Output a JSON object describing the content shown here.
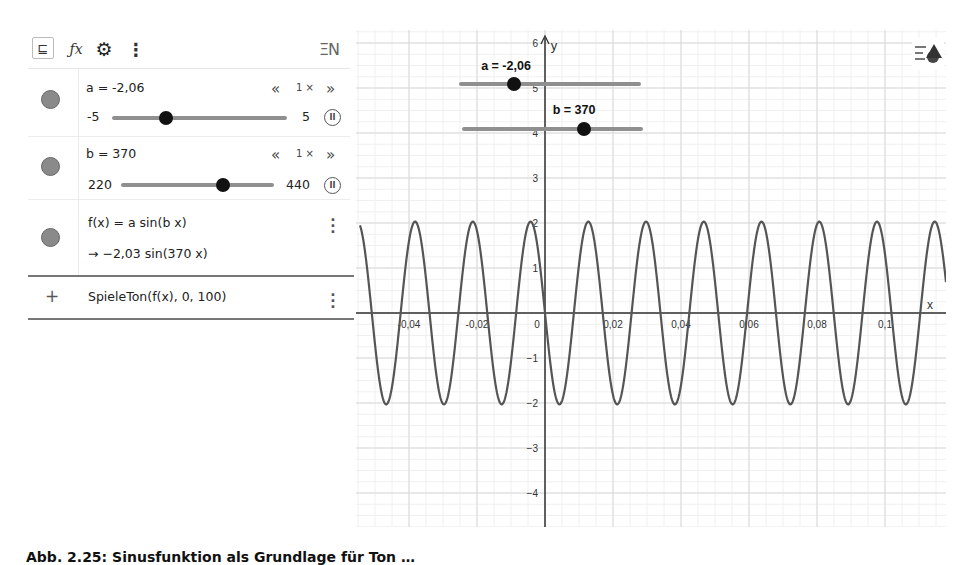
{
  "toolbar": {
    "items": [
      {
        "name": "tree-view-icon",
        "glyph": "⊑"
      },
      {
        "name": "fx-icon",
        "glyph": "ƒx"
      },
      {
        "name": "gear-icon",
        "glyph": "⚙"
      },
      {
        "name": "more-icon",
        "glyph": "⋮"
      }
    ],
    "right_icon": "keyboard-input-icon",
    "right_glyph": "ΞN"
  },
  "algebra": {
    "sliders": [
      {
        "name": "a",
        "label": "a = -2,06",
        "min_label": "-5",
        "max_label": "5",
        "min": -5,
        "max": 5,
        "value": -2.06,
        "speed_label": "1 ×",
        "speed_down": "«",
        "speed_up": "»",
        "color": "#8a8a8a"
      },
      {
        "name": "b",
        "label": "b = 370",
        "min_label": "220",
        "max_label": "440",
        "min": 220,
        "max": 440,
        "value": 370,
        "speed_label": "1 ×",
        "speed_down": "«",
        "speed_up": "»",
        "color": "#8a8a8a"
      }
    ],
    "function": {
      "definition": "f(x) = a  sin(b x)",
      "value": "→  −2,03  sin(370 x)",
      "color": "#8a8a8a"
    },
    "input": {
      "plus": "+",
      "command": "SpieleTon(f(x), 0, 100)"
    }
  },
  "graphics": {
    "x_axis_label": "x",
    "y_axis_label": "y",
    "x_ticks": [
      {
        "v": -0.04,
        "label": "-0,04"
      },
      {
        "v": -0.02,
        "label": "-0,02"
      },
      {
        "v": 0,
        "label": "0"
      },
      {
        "v": 0.02,
        "label": "0,02"
      },
      {
        "v": 0.04,
        "label": "0,04"
      },
      {
        "v": 0.06,
        "label": "0,06"
      },
      {
        "v": 0.08,
        "label": "0,08"
      },
      {
        "v": 0.1,
        "label": "0,1"
      }
    ],
    "y_ticks": [
      {
        "v": 6,
        "label": "6"
      },
      {
        "v": 5,
        "label": "5"
      },
      {
        "v": 4,
        "label": "4"
      },
      {
        "v": 3,
        "label": "3"
      },
      {
        "v": 2,
        "label": "2"
      },
      {
        "v": 1,
        "label": "1"
      },
      {
        "v": -1,
        "label": "−1"
      },
      {
        "v": -2,
        "label": "−2"
      },
      {
        "v": -3,
        "label": "−3"
      },
      {
        "v": -4,
        "label": "−4"
      }
    ],
    "on_canvas_sliders": [
      {
        "label": "a = -2,06",
        "x1": 105,
        "x2": 283,
        "y": 54,
        "knob_x": 158,
        "label_x": 150,
        "label_y": 40
      },
      {
        "label": "b = 370",
        "x1": 108,
        "x2": 285,
        "y": 99,
        "knob_x": 228,
        "label_x": 218,
        "label_y": 84
      }
    ],
    "style_button_icon": "graphics-style-icon"
  },
  "chart_data": {
    "type": "line",
    "title": "",
    "xlabel": "x",
    "ylabel": "y",
    "function": "f(x) = -2.03 sin(370 x)",
    "amplitude": -2.03,
    "frequency_b": 370,
    "xlim": [
      -0.055,
      0.118
    ],
    "ylim": [
      -4.7,
      6.3
    ],
    "x_ticks": [
      -0.04,
      -0.02,
      0,
      0.02,
      0.04,
      0.06,
      0.08,
      0.1
    ],
    "y_ticks": [
      -4,
      -3,
      -2,
      -1,
      1,
      2,
      3,
      4,
      5,
      6
    ],
    "grid": true,
    "series": [
      {
        "name": "f",
        "color": "#555555"
      }
    ]
  },
  "caption": {
    "text": "Abb. 2.25: Sinusfunktion als Grundlage für Ton …"
  }
}
